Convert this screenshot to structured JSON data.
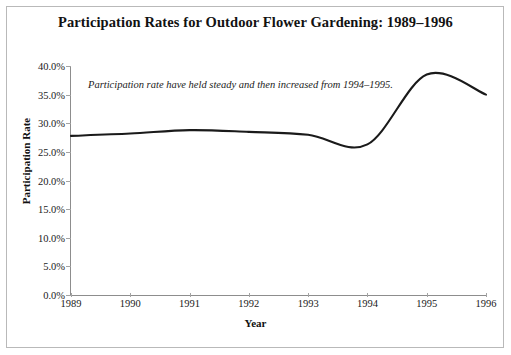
{
  "chart_data": {
    "type": "line",
    "title": "Participation Rates for Outdoor Flower Gardening: 1989–1996",
    "xlabel": "Year",
    "ylabel": "Participation Rate",
    "categories": [
      "1989",
      "1990",
      "1991",
      "1992",
      "1993",
      "1994",
      "1995",
      "1996"
    ],
    "x": [
      1989,
      1990,
      1991,
      1992,
      1993,
      1994,
      1995,
      1996
    ],
    "values": [
      27.8,
      28.2,
      28.8,
      28.5,
      28.0,
      26.3,
      38.5,
      35.0
    ],
    "series": [
      {
        "name": "Participation Rate",
        "values": [
          27.8,
          28.2,
          28.8,
          28.5,
          28.0,
          26.3,
          38.5,
          35.0
        ]
      }
    ],
    "ylim": [
      0.0,
      40.0
    ],
    "xlim": [
      1989,
      1996
    ],
    "ytick_labels": [
      "0.0%",
      "5.0%",
      "10.0%",
      "15.0%",
      "20.0%",
      "25.0%",
      "30.0%",
      "35.0%",
      "40.0%"
    ],
    "ytick_values": [
      0,
      5,
      10,
      15,
      20,
      25,
      30,
      35,
      40
    ],
    "xtick_labels": [
      "1989",
      "1990",
      "1991",
      "1992",
      "1993",
      "1994",
      "1995",
      "1996"
    ],
    "grid": false,
    "legend": "none",
    "line_color": "#1a1a1a",
    "annotations": [
      {
        "text": "Participation rate have held steady and then increased from 1994–1995.",
        "x": 1989.3,
        "y": 36.5
      }
    ]
  },
  "colors": {
    "background": "#ffffff",
    "line": "#1a1a1a",
    "axis": "#8d8d8d",
    "text": "#111111",
    "border": "#b9b9b9"
  }
}
